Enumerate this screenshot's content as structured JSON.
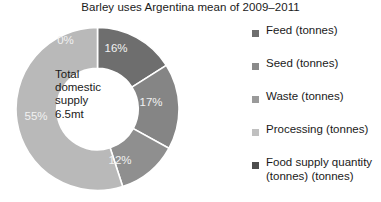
{
  "chart_data": {
    "type": "pie",
    "variant": "donut",
    "title": "Barley uses Argentina mean of 2009–2011",
    "categories": [
      "Feed (tonnes)",
      "Seed (tonnes)",
      "Waste (tonnes)",
      "Processing (tonnes)",
      "Food supply quantity (tonnes) (tonnes)"
    ],
    "values": [
      0,
      16,
      17,
      12,
      55
    ],
    "value_labels": [
      "0%",
      "16%",
      "17%",
      "12%",
      "55%"
    ],
    "unit": "percent",
    "colors": [
      "#b9b9b9",
      "#6e6e6e",
      "#858585",
      "#8f8f8f",
      "#b9b9b9"
    ],
    "slice_border_color": "#ffffff",
    "label_color": "#f2f2f2",
    "start_angle_deg": 0,
    "direction": "clockwise",
    "hole_ratio": 0.5,
    "legend_position": "right",
    "grid": false,
    "center_annotation": {
      "line1": "Total",
      "line2": "domestic",
      "line3": "supply",
      "line4": "6.5mt"
    },
    "slices": [
      {
        "label": "Feed (tonnes)",
        "short": "Feed",
        "percent": 0,
        "text": "0%",
        "color": "#b9b9b9",
        "label_x": 49.5,
        "label_y": 13.5
      },
      {
        "label": "Seed (tonnes)",
        "short": "Seed",
        "percent": 16,
        "text": "16%",
        "color": "#6e6e6e",
        "label_x": 100.0,
        "label_y": 22.0
      },
      {
        "label": "Waste (tonnes)",
        "short": "Waste",
        "percent": 17,
        "text": "17%",
        "color": "#858585",
        "label_x": 135.0,
        "label_y": 76.0
      },
      {
        "label": "Processing (tonnes)",
        "short": "Processing",
        "percent": 12,
        "text": "12%",
        "color": "#8f8f8f",
        "label_x": 104.0,
        "label_y": 134.0
      },
      {
        "label": "Food supply quantity (tonnes) (tonnes)",
        "short": "Food supply quantity",
        "percent": 55,
        "text": "55%",
        "color": "#b9b9b9",
        "label_x": 20.0,
        "label_y": 90.0
      }
    ]
  },
  "legend": {
    "items": [
      {
        "label": "Feed (tonnes)",
        "color": "#6e6e6e"
      },
      {
        "label": "Seed (tonnes)",
        "color": "#8a8a8a"
      },
      {
        "label": "Waste (tonnes)",
        "color": "#9a9a9a"
      },
      {
        "label": "Processing (tonnes)",
        "color": "#c0c0c0"
      },
      {
        "label": "Food supply quantity (tonnes) (tonnes)",
        "color": "#4d4d4d"
      }
    ]
  }
}
